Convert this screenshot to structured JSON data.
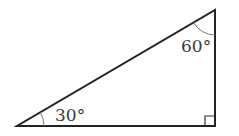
{
  "diagram": {
    "type": "right-triangle",
    "vertices": {
      "bottom_left": [
        17,
        126
      ],
      "bottom_right": [
        215,
        126
      ],
      "top": [
        215,
        10
      ]
    },
    "angles": [
      {
        "vertex": "bottom_left",
        "label": "30°"
      },
      {
        "vertex": "top",
        "label": "60°"
      },
      {
        "vertex": "bottom_right",
        "label": "right-angle",
        "marker": "square"
      }
    ],
    "colors": {
      "stroke": "#222222",
      "arc": "#777777",
      "label": "#3a3a3a"
    }
  }
}
